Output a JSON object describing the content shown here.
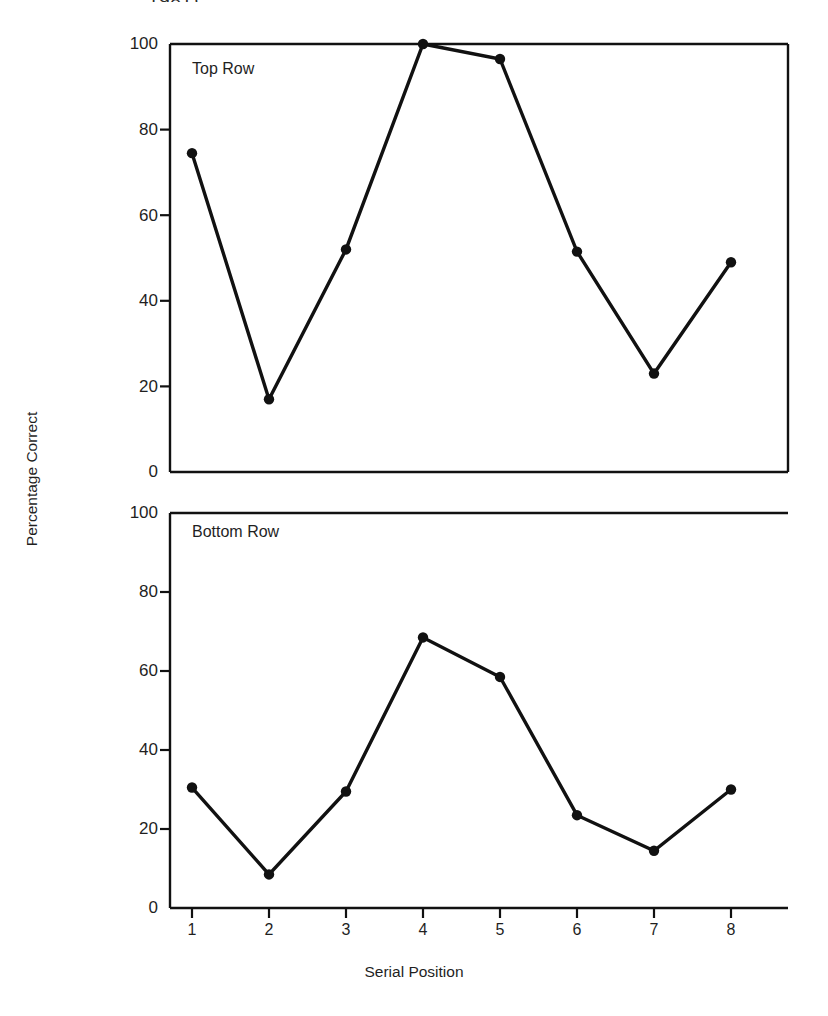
{
  "caption_fragment": "1981).",
  "chart_data": {
    "type": "line",
    "title": "",
    "xlabel": "Serial Position",
    "ylabel": "Percentage Correct",
    "x": [
      1,
      2,
      3,
      4,
      5,
      6,
      7,
      8
    ],
    "xtick_labels": [
      "1",
      "2",
      "3",
      "4",
      "5",
      "6",
      "7",
      "8"
    ],
    "ytick_labels": [
      "0",
      "20",
      "40",
      "60",
      "80",
      "100"
    ],
    "yticks": [
      0,
      20,
      40,
      60,
      80,
      100
    ],
    "ylim": [
      0,
      100
    ],
    "xlim": [
      0.5,
      8.5
    ],
    "grid": false,
    "legend": "none",
    "marker": "filled-circle",
    "line_color": "#111111",
    "panels": [
      {
        "name": "top-panel",
        "label": "Top Row",
        "values": [
          74.5,
          17.0,
          52.0,
          100.0,
          96.5,
          51.5,
          23.0,
          49.0
        ]
      },
      {
        "name": "bottom-panel",
        "label": "Bottom Row",
        "values": [
          30.5,
          8.5,
          29.5,
          68.5,
          58.5,
          23.5,
          14.5,
          30.0
        ]
      }
    ]
  }
}
